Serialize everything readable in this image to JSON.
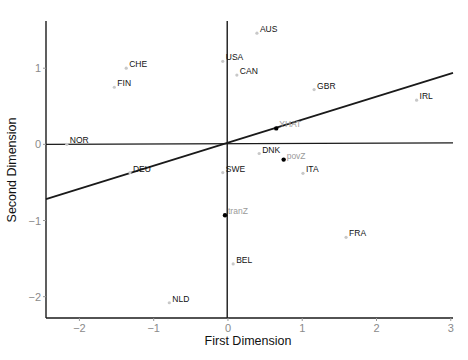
{
  "chart_data": {
    "type": "scatter",
    "title": "",
    "xlabel": "First Dimension",
    "ylabel": "Second Dimension",
    "xlim": [
      -2.45,
      3.03
    ],
    "ylim": [
      -2.28,
      1.62
    ],
    "x_ticks": [
      -2,
      -1,
      0,
      1,
      2,
      3
    ],
    "y_ticks": [
      -2,
      -1,
      0,
      1
    ],
    "grid": false,
    "legend": null,
    "reference_lines": [
      {
        "name": "horizontal-zero-line",
        "x1": -2.45,
        "y1": 0.0,
        "x2": 3.03,
        "y2": 0.02
      },
      {
        "name": "vertical-zero-line",
        "x1": -0.01,
        "y1": -2.28,
        "x2": -0.01,
        "y2": 1.62
      },
      {
        "name": "yhat-direction-line",
        "x1": -2.45,
        "y1": -0.72,
        "x2": 3.03,
        "y2": 0.94
      }
    ],
    "series": [
      {
        "name": "countries",
        "marker": "small grey dot",
        "points": [
          {
            "label": "AUS",
            "x": 0.39,
            "y": 1.46
          },
          {
            "label": "USA",
            "x": -0.07,
            "y": 1.09
          },
          {
            "label": "CAN",
            "x": 0.12,
            "y": 0.91
          },
          {
            "label": "GBR",
            "x": 1.16,
            "y": 0.72
          },
          {
            "label": "IRL",
            "x": 2.54,
            "y": 0.58
          },
          {
            "label": "CHE",
            "x": -1.37,
            "y": 1.0
          },
          {
            "label": "FIN",
            "x": -1.53,
            "y": 0.75
          },
          {
            "label": "NOR",
            "x": -2.17,
            "y": 0.0
          },
          {
            "label": "DEU",
            "x": -1.32,
            "y": -0.37
          },
          {
            "label": "DNK",
            "x": 0.42,
            "y": -0.12
          },
          {
            "label": "SWE",
            "x": -0.07,
            "y": -0.37
          },
          {
            "label": "ITA",
            "x": 1.01,
            "y": -0.38
          },
          {
            "label": "BEL",
            "x": 0.07,
            "y": -1.57
          },
          {
            "label": "FRA",
            "x": 1.59,
            "y": -1.22
          },
          {
            "label": "NLD",
            "x": -0.79,
            "y": -2.08
          }
        ]
      },
      {
        "name": "variables",
        "marker": "black dot",
        "points": [
          {
            "label": "YHAT",
            "x": 0.65,
            "y": 0.21
          },
          {
            "label": "povZ",
            "x": 0.75,
            "y": -0.2
          },
          {
            "label": "tranZ",
            "x": -0.04,
            "y": -0.93
          }
        ]
      }
    ]
  },
  "colors": {
    "axis": "#1a1a1a",
    "tick_label": "#8a8a8a",
    "country_point": "#c8c8c8",
    "country_label": "#111111",
    "variable_point": "#000000",
    "variable_label": "#9a9a9a"
  }
}
